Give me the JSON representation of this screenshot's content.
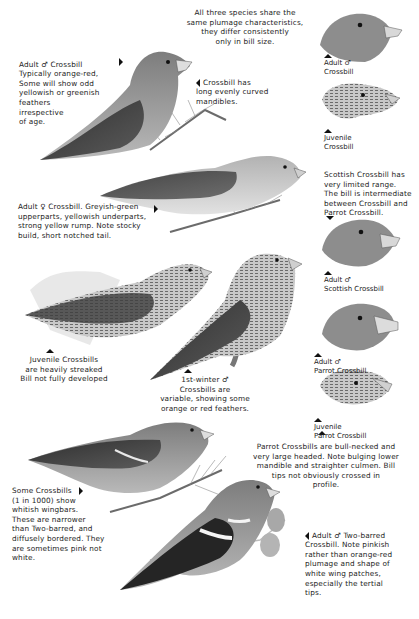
{
  "page": {
    "theme": "Crossbill identification plate",
    "palette": {
      "background": "#ffffff",
      "ink": "#1a1a1a",
      "bird_dark": "#3a3a3a",
      "bird_mid": "#8a8a8a",
      "bird_light": "#d6d6d6"
    }
  },
  "intro_note": "All three species share the\nsame plumage characteristics,\nthey differ consistently\nonly in bill size.",
  "notes": {
    "adult_male": "Adult ♂ Crossbill\nTypically orange-red,\nSome will show odd\nyellowish or greenish\nfeathers\nirrespective\nof age.",
    "bill_shape": "Crossbill has\nlong evenly curved\nmandibles.",
    "adult_female": "Adult ♀ Crossbill. Greyish-green\nupperparts, yellowish underparts,\nstrong yellow rump. Note stocky\nbuild, short notched tail.",
    "juvenile": "Juvenile Crossbills\nare heavily streaked\nBill not fully developed",
    "first_winter_male": "1st-winter ♂\nCrossbills are\nvariable, showing some\norange or red feathers.",
    "scottish": "Scottish Crossbill has\nvery limited range.\nThe bill is intermediate\nbetween Crossbill and\nParrot Crossbill.",
    "parrot": "Parrot Crossbills are bull-necked and\nvery large headed. Note bulging lower\nmandible and straighter culmen. Bill\ntips not obviously crossed in\nprofile.",
    "wingbars": "Some Crossbills\n(1 in 1000) show\nwhitish wingbars.\nThese are narrower\nthan Two-barred, and\ndiffusely bordered. They\nare sometimes pink not\nwhite.",
    "two_barred": "Adult ♂ Two-barred\nCrossbill. Note pinkish\nrather than orange-red\nplumage and shape of\nwhite wing patches,\nespecially the tertial\ntips."
  },
  "head_labels": {
    "adult_male_crossbill": "Adult ♂\nCrossbill",
    "juvenile_crossbill": "Juvenile\nCrossbill",
    "adult_male_scottish": "Adult ♂\nScottish Crossbill",
    "adult_male_parrot": "Adult ♂\nParrot Crossbill",
    "juvenile_parrot": "Juvenile\nParrot Crossbill"
  },
  "illustrations": [
    {
      "id": "adult-male-crossbill",
      "type": "full-body"
    },
    {
      "id": "adult-female-crossbill",
      "type": "full-body"
    },
    {
      "id": "juvenile-crossbill",
      "type": "full-body"
    },
    {
      "id": "first-winter-male-crossbill",
      "type": "full-body"
    },
    {
      "id": "wingbarred-crossbill",
      "type": "full-body"
    },
    {
      "id": "two-barred-crossbill",
      "type": "full-body"
    },
    {
      "id": "head-adult-male-crossbill",
      "type": "head"
    },
    {
      "id": "head-juvenile-crossbill",
      "type": "head"
    },
    {
      "id": "head-adult-male-scottish",
      "type": "head"
    },
    {
      "id": "head-adult-male-parrot",
      "type": "head"
    },
    {
      "id": "head-juvenile-parrot",
      "type": "head"
    }
  ]
}
